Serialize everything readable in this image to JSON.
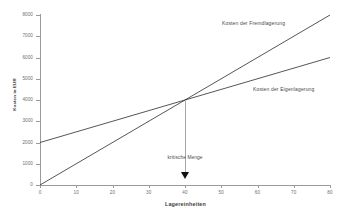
{
  "chart_data": {
    "type": "line",
    "title": "",
    "xlabel": "Lagereinheiten",
    "ylabel": "Kosten in EUR",
    "xlim": [
      0,
      80
    ],
    "ylim": [
      0,
      8000
    ],
    "grid": false,
    "legend_position": "inline-right",
    "x_ticks": [
      "0",
      "10",
      "20",
      "30",
      "40",
      "50",
      "60",
      "70",
      "80"
    ],
    "x_tick_values": [
      0,
      10,
      20,
      30,
      40,
      50,
      60,
      70,
      80
    ],
    "y_ticks": [
      "0",
      "1000",
      "2000",
      "3000",
      "4000",
      "5000",
      "6000",
      "7000",
      "8000"
    ],
    "y_tick_values": [
      0,
      1000,
      2000,
      3000,
      4000,
      5000,
      6000,
      7000,
      8000
    ],
    "series": [
      {
        "name": "Kosten der Fremdlagerung",
        "x": [
          0,
          40,
          80
        ],
        "values": [
          0,
          4000,
          8000
        ],
        "intercept": 0,
        "slope": 100,
        "color": "#2b2b2b"
      },
      {
        "name": "Kosten der Eigenlagerung",
        "x": [
          0,
          40,
          80
        ],
        "values": [
          2000,
          4000,
          6000
        ],
        "intercept": 2000,
        "slope": 50,
        "color": "#2b2b2b"
      }
    ],
    "annotations": [
      {
        "text": "kritische Menge",
        "x": 40,
        "y": 4000,
        "marker": "down-arrow"
      }
    ]
  },
  "axes": {
    "x_title": "Lagereinheiten",
    "y_title": "Kosten in EUR"
  },
  "labels": {
    "fremdlagerung": "Kosten der Fremdlagerung",
    "eigenlagerung": "Kosten der Eigenlagerung",
    "kritische_menge": "kritische Menge"
  },
  "colors": {
    "line": "#2b2b2b",
    "axis": "#9a9a9a",
    "text": "#4a4a4a",
    "arrow": "#111111",
    "background": "#ffffff"
  }
}
